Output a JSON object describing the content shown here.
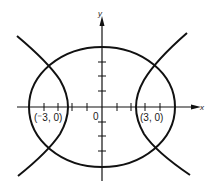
{
  "diagram": {
    "type": "conic-sections",
    "axes": {
      "x_label": "x",
      "y_label": "y",
      "origin_label": "0"
    },
    "points": [
      {
        "label": "(⁻3, 0)",
        "x": -3,
        "y": 0
      },
      {
        "label": "(3, 0)",
        "x": 3,
        "y": 0
      }
    ],
    "curves": [
      {
        "name": "ellipse",
        "center": [
          0,
          0
        ]
      },
      {
        "name": "hyperbola",
        "center": [
          0,
          0
        ],
        "branches": 2
      }
    ],
    "colors": {
      "stroke": "#111111",
      "background": "#ffffff"
    }
  }
}
